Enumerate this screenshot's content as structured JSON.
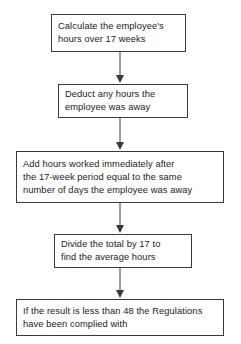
{
  "diagram": {
    "orientation": "vertical",
    "background_color": "#ffffff",
    "border_color": "#3a3a3a",
    "text_color": "#1a1a1a",
    "nodes": [
      {
        "id": "step-1",
        "text": "Calculate the employee's\nhours over 17 weeks",
        "x": 51,
        "y": 14,
        "width": 135,
        "height": 38
      },
      {
        "id": "step-2",
        "text": "Deduct any hours the\nemployee was away",
        "x": 58,
        "y": 84,
        "width": 130,
        "height": 34
      },
      {
        "id": "step-3",
        "text": "Add hours worked immediately after\nthe 17-week period equal to the same\nnumber of days the employee was away",
        "x": 16,
        "y": 151,
        "width": 208,
        "height": 52
      },
      {
        "id": "step-4",
        "text": "Divide the total by 17 to\nfind the average hours",
        "x": 54,
        "y": 234,
        "width": 138,
        "height": 34
      },
      {
        "id": "step-5",
        "text": "If the result is less than 48 the Regulations\nhave been complied with",
        "x": 16,
        "y": 299,
        "width": 208,
        "height": 37
      }
    ],
    "connectors": [
      {
        "id": "arrow-1-to-2",
        "from": "step-1",
        "to": "step-2",
        "x": 113,
        "y": 52,
        "length": 32
      },
      {
        "id": "arrow-2-to-3",
        "from": "step-2",
        "to": "step-3",
        "x": 113,
        "y": 118,
        "length": 33
      },
      {
        "id": "arrow-3-to-4",
        "from": "step-3",
        "to": "step-4",
        "x": 113,
        "y": 203,
        "length": 31
      },
      {
        "id": "arrow-4-to-5",
        "from": "step-4",
        "to": "step-5",
        "x": 113,
        "y": 268,
        "length": 31
      }
    ]
  }
}
